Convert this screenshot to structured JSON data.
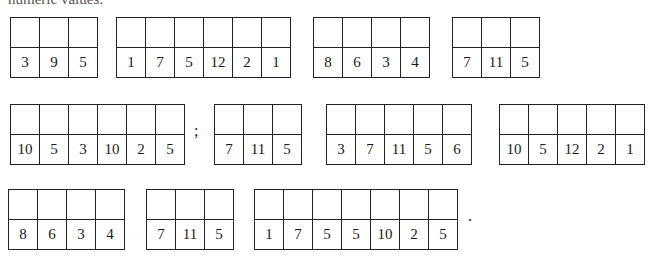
{
  "header_fragment": "numeric values:",
  "rows": [
    {
      "groups": [
        {
          "values": [
            "3",
            "9",
            "5"
          ]
        },
        {
          "values": [
            "1",
            "7",
            "5",
            "12",
            "2",
            "1"
          ]
        },
        {
          "values": [
            "8",
            "6",
            "3",
            "4"
          ]
        },
        {
          "values": [
            "7",
            "11",
            "5"
          ]
        }
      ]
    },
    {
      "groups": [
        {
          "values": [
            "10",
            "5",
            "3",
            "10",
            "2",
            "5"
          ],
          "suffix": ";"
        },
        {
          "values": [
            "7",
            "11",
            "5"
          ]
        },
        {
          "values": [
            "3",
            "7",
            "11",
            "5",
            "6"
          ]
        },
        {
          "values": [
            "10",
            "5",
            "12",
            "2",
            "1"
          ]
        }
      ]
    },
    {
      "groups": [
        {
          "values": [
            "8",
            "6",
            "3",
            "4"
          ]
        },
        {
          "values": [
            "7",
            "11",
            "5"
          ]
        },
        {
          "values": [
            "1",
            "7",
            "5",
            "5",
            "10",
            "2",
            "5"
          ],
          "suffix": "."
        }
      ]
    }
  ]
}
